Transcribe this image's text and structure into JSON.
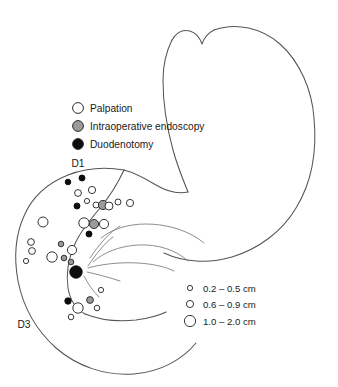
{
  "figure": {
    "kind": "anatomical-diagram",
    "background_color": "#ffffff",
    "outline_color": "#555555"
  },
  "method_legend": {
    "items": [
      {
        "label": "Palpation",
        "fill": "#ffffff",
        "marker": "open-circle"
      },
      {
        "label": "Intraoperative endoscopy",
        "fill": "#9a9a9a",
        "marker": "gray-circle"
      },
      {
        "label": "Duodenotomy",
        "fill": "#0d0d0d",
        "marker": "filled-circle"
      }
    ]
  },
  "size_legend": {
    "items": [
      {
        "label": "0.2 – 0.5 cm",
        "radius": 2.6
      },
      {
        "label": "0.6 – 0.9 cm",
        "radius": 3.6
      },
      {
        "label": "1.0 – 2.0 cm",
        "radius": 5.6
      }
    ]
  },
  "anatomy_labels": [
    {
      "text": "D1",
      "x": 78,
      "y": 167
    },
    {
      "text": "D3",
      "x": 24,
      "y": 328
    }
  ],
  "chart_data": {
    "type": "scatter",
    "title": "",
    "xlabel": "",
    "ylabel": "",
    "series": [
      {
        "name": "Palpation",
        "color": "#ffffff"
      },
      {
        "name": "Intraoperative endoscopy",
        "color": "#9a9a9a"
      },
      {
        "name": "Duodenotomy",
        "color": "#0d0d0d"
      }
    ],
    "points": [
      {
        "x": 82,
        "y": 178,
        "r": 3.0,
        "method": "Duodenotomy"
      },
      {
        "x": 68,
        "y": 182,
        "r": 2.8,
        "method": "Duodenotomy"
      },
      {
        "x": 78,
        "y": 193,
        "r": 3.4,
        "method": "Palpation"
      },
      {
        "x": 92,
        "y": 190,
        "r": 3.6,
        "method": "Palpation"
      },
      {
        "x": 87,
        "y": 201,
        "r": 2.6,
        "method": "Palpation"
      },
      {
        "x": 77,
        "y": 206,
        "r": 3.0,
        "method": "Duodenotomy"
      },
      {
        "x": 96,
        "y": 205,
        "r": 3.0,
        "method": "Palpation"
      },
      {
        "x": 103,
        "y": 205,
        "r": 4.6,
        "method": "Intraoperative endoscopy"
      },
      {
        "x": 109,
        "y": 206,
        "r": 4.0,
        "method": "Palpation"
      },
      {
        "x": 118,
        "y": 202,
        "r": 3.0,
        "method": "Palpation"
      },
      {
        "x": 130,
        "y": 203,
        "r": 3.6,
        "method": "Palpation"
      },
      {
        "x": 84,
        "y": 223,
        "r": 5.2,
        "method": "Palpation"
      },
      {
        "x": 94,
        "y": 224,
        "r": 4.6,
        "method": "Intraoperative endoscopy"
      },
      {
        "x": 104,
        "y": 224,
        "r": 4.6,
        "method": "Palpation"
      },
      {
        "x": 89,
        "y": 234,
        "r": 3.0,
        "method": "Duodenotomy"
      },
      {
        "x": 43,
        "y": 222,
        "r": 5.0,
        "method": "Palpation"
      },
      {
        "x": 31,
        "y": 242,
        "r": 3.4,
        "method": "Palpation"
      },
      {
        "x": 32,
        "y": 251,
        "r": 3.4,
        "method": "Palpation"
      },
      {
        "x": 26,
        "y": 261,
        "r": 2.6,
        "method": "Palpation"
      },
      {
        "x": 61,
        "y": 244,
        "r": 2.8,
        "method": "Intraoperative endoscopy"
      },
      {
        "x": 52,
        "y": 257,
        "r": 5.2,
        "method": "Palpation"
      },
      {
        "x": 64,
        "y": 258,
        "r": 2.8,
        "method": "Intraoperative endoscopy"
      },
      {
        "x": 72,
        "y": 250,
        "r": 4.6,
        "method": "Palpation"
      },
      {
        "x": 71,
        "y": 262,
        "r": 2.8,
        "method": "Intraoperative endoscopy"
      },
      {
        "x": 76,
        "y": 272,
        "r": 6.2,
        "method": "Duodenotomy"
      },
      {
        "x": 68,
        "y": 301,
        "r": 3.2,
        "method": "Duodenotomy"
      },
      {
        "x": 78,
        "y": 308,
        "r": 5.2,
        "method": "Palpation"
      },
      {
        "x": 71,
        "y": 317,
        "r": 2.8,
        "method": "Palpation"
      },
      {
        "x": 90,
        "y": 300,
        "r": 3.4,
        "method": "Intraoperative endoscopy"
      },
      {
        "x": 97,
        "y": 308,
        "r": 2.8,
        "method": "Palpation"
      },
      {
        "x": 101,
        "y": 290,
        "r": 2.6,
        "method": "Palpation"
      }
    ]
  }
}
